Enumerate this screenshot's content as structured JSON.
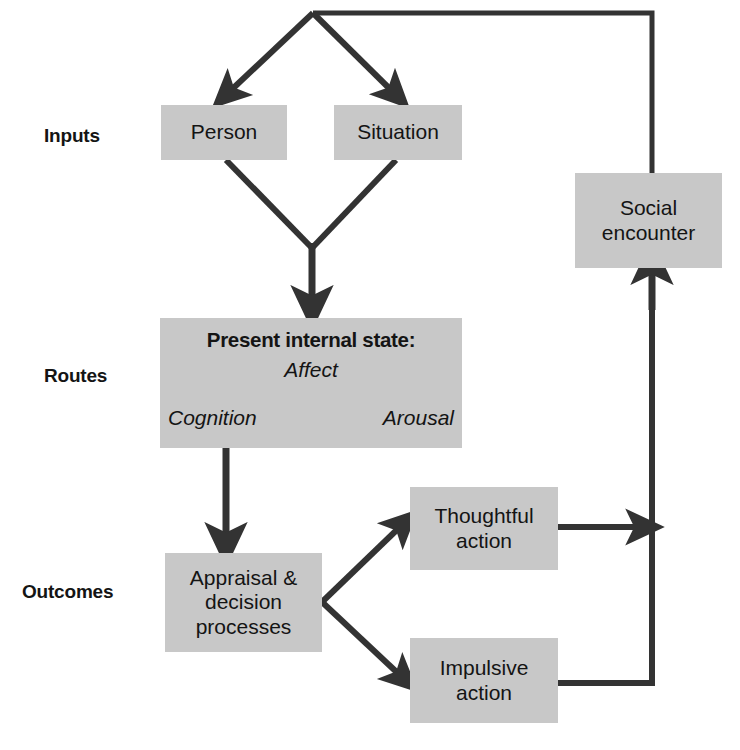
{
  "diagram": {
    "colors": {
      "box_fill": "#c8c8c8",
      "arrow": "#333333",
      "text": "#141414",
      "background": "#ffffff"
    },
    "stage_labels": [
      {
        "id": "inputs",
        "label": "Inputs"
      },
      {
        "id": "routes",
        "label": "Routes"
      },
      {
        "id": "outcomes",
        "label": "Outcomes"
      }
    ],
    "nodes": {
      "person": {
        "label": "Person"
      },
      "situation": {
        "label": "Situation"
      },
      "internal_state": {
        "title": "Present internal state:",
        "terms": {
          "affect": "Affect",
          "cognition": "Cognition",
          "arousal": "Arousal"
        }
      },
      "appraisal": {
        "label": "Appraisal &\ndecision\nprocesses"
      },
      "thoughtful": {
        "label": "Thoughtful\naction"
      },
      "impulsive": {
        "label": "Impulsive\naction"
      },
      "social_encounter": {
        "label": "Social\nencounter"
      }
    },
    "edges": [
      {
        "id": "feedback-to-person",
        "from": "social_encounter",
        "to": "person",
        "style": "solid"
      },
      {
        "id": "feedback-to-situation",
        "from": "social_encounter",
        "to": "situation",
        "style": "solid"
      },
      {
        "id": "person-to-state",
        "from": "person",
        "to": "internal_state",
        "style": "solid"
      },
      {
        "id": "situation-to-state",
        "from": "situation",
        "to": "internal_state",
        "style": "solid"
      },
      {
        "id": "state-to-appraisal",
        "from": "internal_state",
        "to": "appraisal",
        "style": "solid"
      },
      {
        "id": "appraisal-to-thoughtful",
        "from": "appraisal",
        "to": "thoughtful",
        "style": "solid"
      },
      {
        "id": "appraisal-to-impulsive",
        "from": "appraisal",
        "to": "impulsive",
        "style": "solid"
      },
      {
        "id": "thoughtful-to-social",
        "from": "thoughtful",
        "to": "social_encounter",
        "style": "solid"
      },
      {
        "id": "impulsive-to-social",
        "from": "impulsive",
        "to": "social_encounter",
        "style": "solid"
      },
      {
        "id": "affect-cognition",
        "from": "affect",
        "to": "cognition",
        "style": "dashed"
      },
      {
        "id": "affect-arousal",
        "from": "affect",
        "to": "arousal",
        "style": "dashed"
      },
      {
        "id": "cognition-arousal",
        "from": "cognition",
        "to": "arousal",
        "style": "dashed"
      }
    ]
  }
}
